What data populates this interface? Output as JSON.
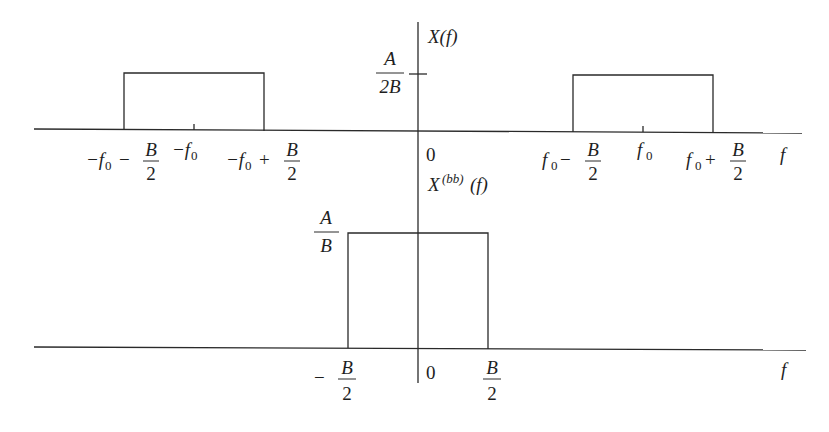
{
  "top_plot": {
    "y_label": "X(f)",
    "x_label": "f",
    "origin_label": "0",
    "amplitude": {
      "numerator": "A",
      "denominator": "2B"
    },
    "left_band": {
      "lower_edge": {
        "prefix": "−f",
        "sub": "0",
        "op": "−",
        "frac_num": "B",
        "frac_den": "2"
      },
      "center": {
        "prefix": "−f",
        "sub": "0"
      },
      "upper_edge": {
        "prefix": "−f",
        "sub": "0",
        "op": "+",
        "frac_num": "B",
        "frac_den": "2"
      }
    },
    "right_band": {
      "lower_edge": {
        "prefix": "f",
        "sub": "0",
        "op": "−",
        "frac_num": "B",
        "frac_den": "2"
      },
      "center": {
        "prefix": "f",
        "sub": "0"
      },
      "upper_edge": {
        "prefix": "f",
        "sub": "0",
        "op": "+",
        "frac_num": "B",
        "frac_den": "2"
      }
    }
  },
  "bottom_plot": {
    "y_label": {
      "base": "X",
      "sup": "(bb)",
      "arg": "(f)"
    },
    "x_label": "f",
    "origin_label": "0",
    "amplitude": {
      "numerator": "A",
      "denominator": "B"
    },
    "lower_edge": {
      "sign": "−",
      "frac_num": "B",
      "frac_den": "2"
    },
    "upper_edge": {
      "frac_num": "B",
      "frac_den": "2"
    }
  }
}
